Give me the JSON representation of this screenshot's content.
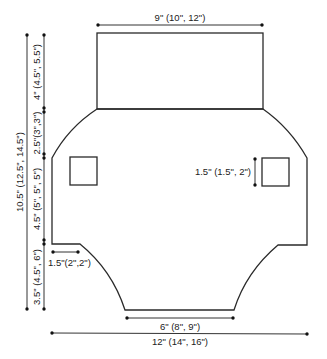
{
  "diagram": {
    "type": "knitting-schematic",
    "colors": {
      "line": "#2a2a2a",
      "text": "#222222",
      "background": "#ffffff"
    },
    "dimensions": {
      "top_width": "9\" (10\", 12\")",
      "top_height": "4\" (4.5\", 5.5\")",
      "shoulder_height": "2.5\"(3\",3\")",
      "total_height": "10.5\" (12.5\", 14.5\")",
      "side_height": "4.5\" (5\", 5\", 5\")",
      "bottom_height": "3.5\" (4.5\", 6\")",
      "notch_width": "1.5\"(2\",2\")",
      "pocket_size": "1.5\" (1.5\", 2\")",
      "bottom_width": "6\" (8\", 9\")",
      "total_width": "12\" (14\", 16\")"
    }
  }
}
